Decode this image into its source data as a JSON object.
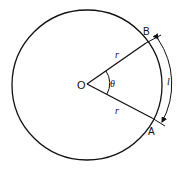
{
  "diagram": {
    "labels": {
      "center": "O",
      "point_b": "B",
      "point_a": "A",
      "radius_upper": "r",
      "radius_lower": "r",
      "angle": "θ",
      "arc_length": "l"
    },
    "colors": {
      "stroke": "#111111",
      "background": "#ffffff"
    }
  }
}
